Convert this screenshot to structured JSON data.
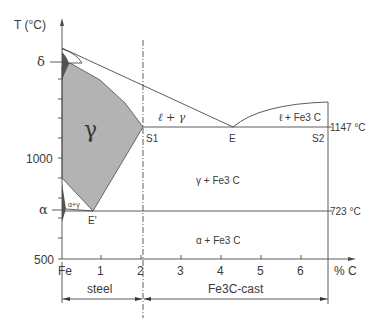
{
  "diagram": {
    "y_axis": {
      "label": "T (°C)",
      "ticks": [
        "δ",
        "1000",
        "α",
        "500"
      ]
    },
    "x_axis": {
      "label": "% C",
      "ticks": [
        "Fe",
        "1",
        "2",
        "3",
        "4",
        "5",
        "6"
      ]
    },
    "regions": {
      "gamma": "γ",
      "liquid_gamma": "ℓ + γ",
      "liquid_fe3c": "ℓ + Fe3 C",
      "gamma_fe3c": "γ + Fe3 C",
      "alpha_gamma": "α+γ",
      "alpha_fe3c": "α + Fe3 C"
    },
    "points": {
      "s1": "S1",
      "e": "E",
      "s2": "S2",
      "e_prime": "E'"
    },
    "temperatures": {
      "eutectic": "1147 °C",
      "eutectoid": "723 °C"
    },
    "ranges": {
      "steel": "steel",
      "cast": "Fe3C-cast"
    },
    "colors": {
      "gamma_fill": "#b3b3b3",
      "dark_fill": "#555555",
      "line": "#4a4a4a"
    }
  }
}
